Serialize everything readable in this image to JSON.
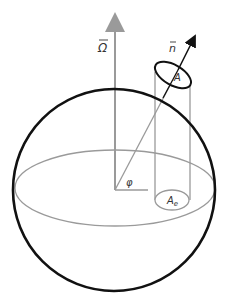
{
  "diagram": {
    "labels": {
      "omega": "Ω",
      "normal": "n",
      "area": "A",
      "area_eq_base": "A",
      "area_eq_sub": "e",
      "angle": "φ"
    },
    "colors": {
      "sphere": "#111111",
      "guide": "#9a9a9a",
      "normal_arrow": "#111111"
    }
  }
}
